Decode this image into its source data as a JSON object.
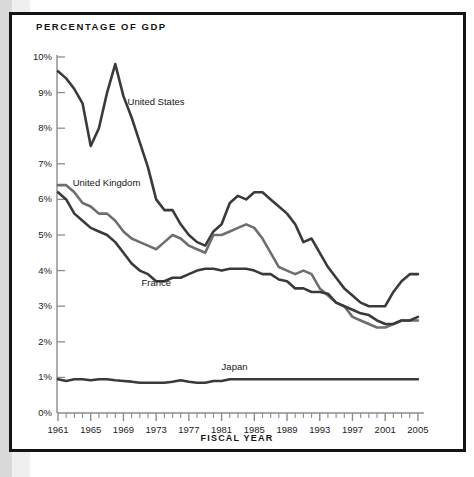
{
  "chart_title": "PERCENTAGE OF GDP",
  "xaxis_title": "FISCAL YEAR",
  "series_labels": {
    "us": "United States",
    "uk": "United Kingdom",
    "fr": "France",
    "jp": "Japan"
  },
  "colors": {
    "dark_line": "#3a3a3a",
    "light_line": "#6e6e6e",
    "axis": "#8c8c8c",
    "text": "#1d1d1d",
    "frame": "#141414",
    "background": "#ffffff",
    "left_strip": "#d9d9d9"
  },
  "chart_data": {
    "type": "line",
    "title": "PERCENTAGE OF GDP",
    "xlabel": "FISCAL YEAR",
    "ylabel": "PERCENTAGE OF GDP",
    "xlim": [
      1961,
      2005
    ],
    "ylim": [
      0,
      10
    ],
    "grid": false,
    "legend": "inline-labels",
    "y_tick_labels": [
      "0%",
      "1%",
      "2%",
      "3%",
      "4%",
      "5%",
      "6%",
      "7%",
      "8%",
      "9%",
      "10%"
    ],
    "y_ticks": [
      0,
      1,
      2,
      3,
      4,
      5,
      6,
      7,
      8,
      9,
      10
    ],
    "x_tick_labels": [
      "1961",
      "1965",
      "1969",
      "1973",
      "1977",
      "1981",
      "1985",
      "1989",
      "1993",
      "1997",
      "2001",
      "2005"
    ],
    "x_ticks_labeled": [
      1961,
      1965,
      1969,
      1973,
      1977,
      1981,
      1985,
      1989,
      1993,
      1997,
      2001,
      2005
    ],
    "x_minor_tick_interval": 1,
    "x": [
      1961,
      1962,
      1963,
      1964,
      1965,
      1966,
      1967,
      1968,
      1969,
      1970,
      1971,
      1972,
      1973,
      1974,
      1975,
      1976,
      1977,
      1978,
      1979,
      1980,
      1981,
      1982,
      1983,
      1984,
      1985,
      1986,
      1987,
      1988,
      1989,
      1990,
      1991,
      1992,
      1993,
      1994,
      1995,
      1996,
      1997,
      1998,
      1999,
      2000,
      2001,
      2002,
      2003,
      2004,
      2005
    ],
    "series": [
      {
        "name": "United States",
        "color": "#3a3a3a",
        "label_x": 1969.5,
        "label_y": 8.75,
        "values": [
          9.6,
          9.4,
          9.1,
          8.7,
          7.5,
          8.0,
          9.0,
          9.8,
          8.9,
          8.3,
          7.6,
          6.9,
          6.0,
          5.7,
          5.7,
          5.3,
          5.0,
          4.8,
          4.7,
          5.1,
          5.3,
          5.9,
          6.1,
          6.0,
          6.2,
          6.2,
          6.0,
          5.8,
          5.6,
          5.3,
          4.8,
          4.9,
          4.5,
          4.1,
          3.8,
          3.5,
          3.3,
          3.1,
          3.0,
          3.0,
          3.0,
          3.4,
          3.7,
          3.9,
          3.9
        ]
      },
      {
        "name": "United Kingdom",
        "color": "#6e6e6e",
        "label_x": 1962.8,
        "label_y": 6.45,
        "values": [
          6.4,
          6.4,
          6.2,
          5.9,
          5.8,
          5.6,
          5.6,
          5.4,
          5.1,
          4.9,
          4.8,
          4.7,
          4.6,
          4.8,
          5.0,
          4.9,
          4.7,
          4.6,
          4.5,
          5.0,
          5.0,
          5.1,
          5.2,
          5.3,
          5.2,
          4.9,
          4.5,
          4.1,
          4.0,
          3.9,
          4.0,
          3.9,
          3.5,
          3.3,
          3.1,
          3.0,
          2.7,
          2.6,
          2.5,
          2.4,
          2.4,
          2.5,
          2.6,
          2.6,
          2.6
        ]
      },
      {
        "name": "France",
        "color": "#3a3a3a",
        "label_x": 1971.2,
        "label_y": 3.65,
        "values": [
          6.2,
          6.0,
          5.6,
          5.4,
          5.2,
          5.1,
          5.0,
          4.8,
          4.5,
          4.2,
          4.0,
          3.9,
          3.7,
          3.7,
          3.8,
          3.8,
          3.9,
          4.0,
          4.05,
          4.05,
          4.0,
          4.05,
          4.05,
          4.05,
          4.0,
          3.9,
          3.9,
          3.75,
          3.7,
          3.5,
          3.5,
          3.4,
          3.4,
          3.35,
          3.1,
          3.0,
          2.9,
          2.8,
          2.75,
          2.6,
          2.5,
          2.5,
          2.6,
          2.6,
          2.7
        ]
      },
      {
        "name": "Japan",
        "color": "#3a3a3a",
        "label_x": 1981.0,
        "label_y": 1.3,
        "values": [
          0.95,
          0.9,
          0.95,
          0.95,
          0.92,
          0.95,
          0.95,
          0.92,
          0.9,
          0.88,
          0.85,
          0.85,
          0.85,
          0.85,
          0.88,
          0.92,
          0.88,
          0.85,
          0.85,
          0.9,
          0.9,
          0.95,
          0.95,
          0.95,
          0.95,
          0.95,
          0.95,
          0.95,
          0.95,
          0.95,
          0.95,
          0.95,
          0.95,
          0.95,
          0.95,
          0.95,
          0.95,
          0.95,
          0.95,
          0.95,
          0.95,
          0.95,
          0.95,
          0.95,
          0.95
        ]
      }
    ]
  }
}
